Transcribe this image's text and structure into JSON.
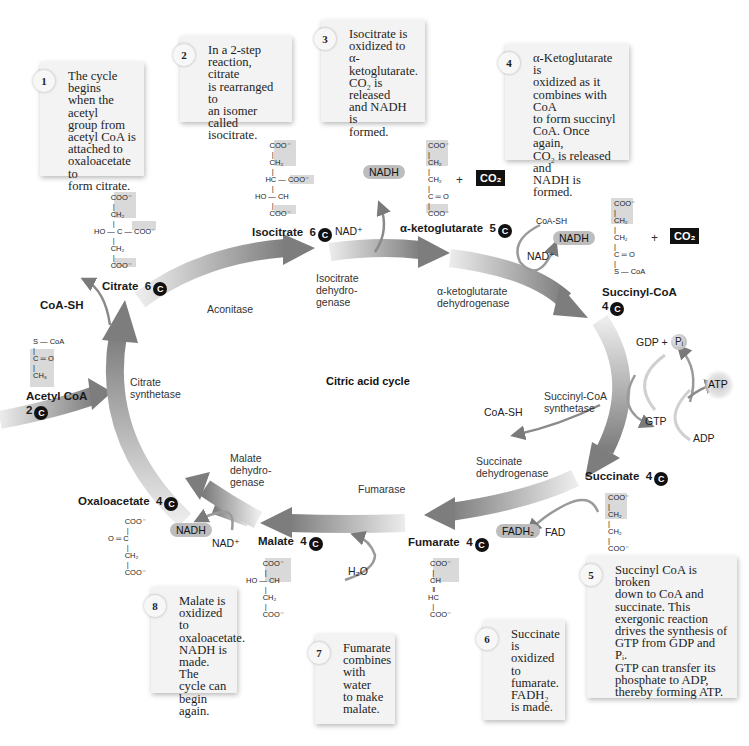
{
  "diagram": {
    "title": "Citric acid cycle"
  },
  "notes": [
    {
      "num": "1",
      "text": "The cycle begins\nwhen the acetyl\ngroup from\nacetyl CoA is\nattached to\noxaloacetate to\nform citrate."
    },
    {
      "num": "2",
      "text": "In a 2-step\nreaction, citrate\nis rearranged to\nan isomer called\nisocitrate."
    },
    {
      "num": "3",
      "text": "Isocitrate is\noxidized to α-\nketoglutarate.\nCO₂ is released\nand NADH is\nformed."
    },
    {
      "num": "4",
      "text": "α-Ketoglutarate is\noxidized as it\ncombines with CoA\nto form succinyl\nCoA. Once again,\nCO₂ is released and\nNADH is formed."
    },
    {
      "num": "5",
      "text": "Succinyl CoA is broken\ndown to CoA and\nsuccinate. This\nexergonic reaction\ndrives the synthesis of\nGTP from GDP and Pᵢ.\nGTP can transfer its\nphosphate to ADP,\nthereby forming  ATP."
    },
    {
      "num": "6",
      "text": "Succinate is\noxidized to\nfumarate.\nFADH₂\nis made."
    },
    {
      "num": "7",
      "text": "Fumarate\ncombines\nwith water\nto make\nmalate."
    },
    {
      "num": "8",
      "text": "Malate is\noxidized to\noxaloacetate.\nNADH is\nmade. The\ncycle can\nbegin again."
    }
  ],
  "compounds": {
    "acetyl_coa": {
      "name": "Acetyl CoA",
      "carbons": "2",
      "structure": "S — CoA\n|\nC ═ O\n|\nCH₃"
    },
    "citrate": {
      "name": "Citrate",
      "carbons": "6",
      "structure": "        COO⁻\n         |\n        CH₂\n         |\nHO — C — COO⁻\n         |\n        CH₂\n         |\n        COO⁻"
    },
    "isocitrate": {
      "name": "Isocitrate",
      "carbons": "6",
      "structure": "       COO⁻\n        |\n       CH₂\n        |\n     HC — COO⁻\n        |\nHO — CH\n        |\n       COO⁻"
    },
    "alpha_ketoglutarate": {
      "name": "α-ketoglutarate",
      "carbons": "5",
      "structure": "COO⁻\n|\nCH₂\n|\nCH₂\n|\nC ═ O\n|\nCOO⁻"
    },
    "succinyl_coa": {
      "name": "Succinyl-CoA",
      "carbons": "4",
      "structure": "COO⁻\n|\nCH₂\n|\nCH₂\n|\nC ═ O\n|\nS — CoA"
    },
    "succinate": {
      "name": "Succinate",
      "carbons": "4",
      "structure": "COO⁻\n|\nCH₂\n|\nCH₂\n|\nCOO⁻"
    },
    "fumarate": {
      "name": "Fumarate",
      "carbons": "4",
      "structure": " COO⁻\n  |\n CH\n  ‖\nHC\n  |\n COO⁻"
    },
    "malate": {
      "name": "Malate",
      "carbons": "4",
      "structure": "        COO⁻\n         |\nHO — CH\n         |\n        CH₂\n         |\n        COO⁻"
    },
    "oxaloacetate": {
      "name": "Oxaloacetate",
      "carbons": "4",
      "structure": "        COO⁻\n         |\nO ═ C\n         |\n        CH₂\n         |\n        COO⁻"
    }
  },
  "enzymes": {
    "citrate_synthetase": "Citrate\nsynthetase",
    "aconitase": "Aconitase",
    "isocitrate_dh": "Isocitrate\ndehydro-\ngenase",
    "akg_dh": "α-ketoglutarate\ndehydrogenase",
    "succinyl_coa_synthetase": "Succinyl-CoA\nsynthetase",
    "succinate_dh": "Succinate\ndehydrogenase",
    "fumarase": "Fumarase",
    "malate_dh": "Malate\ndehydro-\ngenase"
  },
  "cofactors": {
    "coa_sh_top": "CoA-SH",
    "nadh_1": "NADH",
    "nad_1": "NAD⁺",
    "co2_1": "CO₂",
    "coa_sh_2": "CoA-SH",
    "nadh_2": "NADH",
    "nad_2": "NAD⁺",
    "co2_2": "CO₂",
    "gdp_pi": "GDP +",
    "pi": "Pᵢ",
    "atp": "ATP",
    "gtp": "GTP",
    "adp": "ADP",
    "coa_sh_3": "CoA-SH",
    "fadh2": "FADH₂",
    "fad": "FAD",
    "h2o": "H₂O",
    "nadh_3": "NADH",
    "nad_3": "NAD⁺",
    "plus": "+"
  },
  "colors": {
    "arrow_dark": "#7a7a7a",
    "arrow_light": "#e6e6e6",
    "note_bg": "#f3f3f3",
    "highlight": "#d9d9d9",
    "co2_bg": "#111111",
    "carbon_badge": "#111111"
  }
}
